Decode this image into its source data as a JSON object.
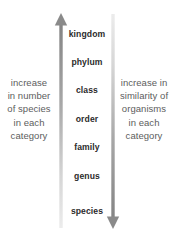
{
  "diagram": {
    "background_color": "#ffffff",
    "label_color": "#2b2b2b",
    "side_text_color": "#5d5d5d",
    "arrow_dark_color": "#8a8a8a",
    "arrow_light_color": "#e2e2e2"
  },
  "left_column": {
    "text": "increase\nin number\nof species\nin each\ncategory",
    "lines": [
      "increase",
      "in number",
      "of species",
      "in each",
      "category"
    ]
  },
  "right_column": {
    "text": "increase in\nsimilarity of\norganisms\nin each\ncategory",
    "lines": [
      "increase in",
      "similarity of",
      "organisms",
      "in each",
      "category"
    ]
  },
  "ranks": [
    {
      "label": "kingdom",
      "y": 29
    },
    {
      "label": "phylum",
      "y": 57
    },
    {
      "label": "class",
      "y": 85
    },
    {
      "label": "order",
      "y": 114
    },
    {
      "label": "family",
      "y": 142
    },
    {
      "label": "genus",
      "y": 171
    },
    {
      "label": "species",
      "y": 206
    }
  ],
  "arrows": {
    "left": {
      "name": "increase-number-of-species-arrow",
      "direction": "up",
      "x": 61,
      "head_y": 14,
      "tail_y": 228
    },
    "right": {
      "name": "increase-similarity-arrow",
      "direction": "down",
      "x": 113,
      "head_y": 228,
      "tail_y": 14
    }
  }
}
